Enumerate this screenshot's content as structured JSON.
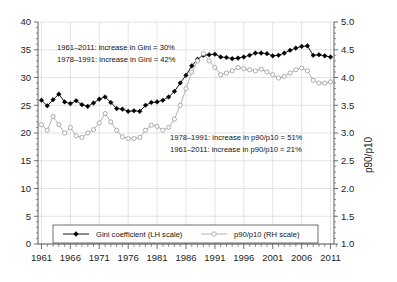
{
  "chart_data": {
    "type": "line",
    "title": "",
    "xlabel": "",
    "ylabel": "",
    "ylabel_right": "p90/p10",
    "grid": true,
    "legend_position": "bottom",
    "xlim": [
      1961,
      2012
    ],
    "ylim": [
      0,
      40
    ],
    "ylim_right": [
      1.0,
      5.0
    ],
    "xticks": [
      1961,
      1966,
      1971,
      1976,
      1981,
      1986,
      1991,
      1996,
      2001,
      2006,
      2011
    ],
    "xtick_labels": [
      "1961",
      "1966",
      "1971",
      "1976",
      "1981",
      "1986",
      "1991",
      "1996",
      "2001",
      "2006",
      "2011"
    ],
    "yticks": [
      0,
      5,
      10,
      15,
      20,
      25,
      30,
      35,
      40
    ],
    "ytick_labels": [
      "0",
      "5",
      "10",
      "15",
      "20",
      "25",
      "30",
      "35",
      "40"
    ],
    "yticks_right": [
      1.0,
      1.5,
      2.0,
      2.5,
      3.0,
      3.5,
      4.0,
      4.5,
      5.0
    ],
    "ytick_labels_right": [
      "1.0",
      "1.5",
      "2.0",
      "2.5",
      "3.0",
      "3.5",
      "4.0",
      "4.5",
      "5.0"
    ],
    "x": [
      1961,
      1962,
      1963,
      1964,
      1965,
      1966,
      1967,
      1968,
      1969,
      1970,
      1971,
      1972,
      1973,
      1974,
      1975,
      1976,
      1977,
      1978,
      1979,
      1980,
      1981,
      1982,
      1983,
      1984,
      1985,
      1986,
      1987,
      1988,
      1989,
      1990,
      1991,
      1992,
      1993,
      1994,
      1995,
      1996,
      1997,
      1998,
      1999,
      2000,
      2001,
      2002,
      2003,
      2004,
      2005,
      2006,
      2007,
      2008,
      2009,
      2010,
      2011
    ],
    "series": [
      {
        "name": "Gini coefficient (LH scale)",
        "axis": "left",
        "marker": "filled-diamond",
        "color": "#000000",
        "values": [
          25.9,
          24.9,
          26.0,
          27.0,
          25.6,
          25.3,
          25.8,
          25.1,
          24.8,
          25.4,
          26.1,
          26.5,
          25.5,
          24.4,
          24.3,
          23.9,
          24.0,
          23.9,
          25.0,
          25.5,
          25.6,
          25.9,
          26.5,
          27.5,
          29.0,
          30.4,
          32.1,
          33.3,
          34.0,
          34.1,
          34.2,
          33.7,
          33.6,
          33.4,
          33.5,
          33.7,
          34.0,
          34.4,
          34.4,
          34.3,
          33.9,
          34.0,
          34.4,
          34.9,
          35.3,
          35.6,
          35.7,
          34.0,
          34.1,
          33.9,
          33.7
        ]
      },
      {
        "name": "p90/p10 (RH scale)",
        "axis": "right",
        "marker": "open-circle",
        "color": "#a8a8a8",
        "values": [
          3.15,
          3.05,
          3.3,
          3.15,
          3.0,
          3.1,
          2.95,
          2.92,
          3.0,
          3.06,
          3.18,
          3.35,
          3.2,
          3.05,
          2.93,
          2.9,
          2.9,
          2.92,
          3.05,
          3.14,
          3.12,
          3.05,
          3.1,
          3.25,
          3.5,
          3.8,
          4.1,
          4.3,
          4.43,
          4.3,
          4.18,
          4.05,
          4.08,
          4.12,
          4.18,
          4.16,
          4.14,
          4.12,
          4.15,
          4.1,
          4.05,
          3.99,
          4.02,
          4.08,
          4.14,
          4.17,
          4.12,
          3.95,
          3.9,
          3.9,
          3.92
        ]
      }
    ],
    "annotations": [
      {
        "name": "gini-1961-2011",
        "text": "1961–2011: increase in Gini = 30%"
      },
      {
        "name": "gini-1978-1991",
        "text": "1978–1991: increase in Gini = 42%"
      },
      {
        "name": "p90-1978-1991",
        "text": "1978–1991: increase in p90/p10 = 51%"
      },
      {
        "name": "p90-1961-2011",
        "text": "1961–2011: increase in p90/p10 = 21%"
      }
    ],
    "legend": [
      {
        "label": "Gini coefficient (LH scale)",
        "marker": "filled-diamond",
        "color": "#000000"
      },
      {
        "label": "p90/p10 (RH scale)",
        "marker": "open-circle",
        "color": "#a8a8a8"
      }
    ]
  }
}
